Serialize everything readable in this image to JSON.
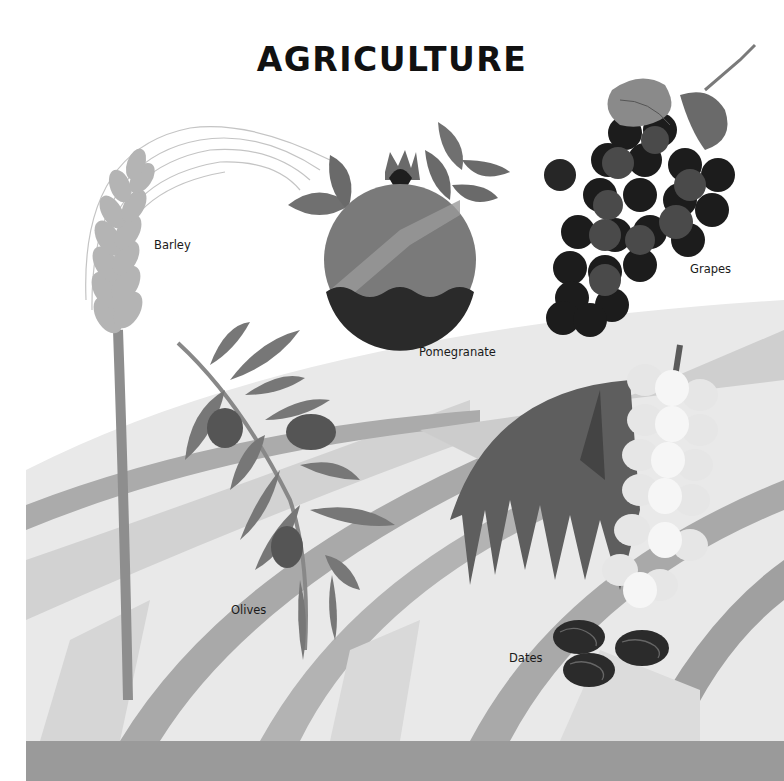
{
  "page": {
    "title": "AGRICULTURE"
  },
  "labels": {
    "barley": "Barley",
    "pomegranate": "Pomegranate",
    "grapes": "Grapes",
    "olives": "Olives",
    "dates": "Dates"
  },
  "palette": {
    "background": "#ffffff",
    "field_light": "#e6e6e6",
    "field_mid": "#cfcfcf",
    "field_stripe": "#a9a9a9",
    "ground_band": "#9a9a9a",
    "barley": "#b4b4b4",
    "barley_stem": "#8e8e8e",
    "pomegranate": "#777777",
    "pomegranate_dark": "#2a2a2a",
    "leaf": "#6f6f6f",
    "grape_dark": "#1c1c1c",
    "grape_mid": "#4a4a4a",
    "white_grape": "#ececec",
    "palm_leaf": "#5e5e5e",
    "date": "#2b2b2b"
  }
}
